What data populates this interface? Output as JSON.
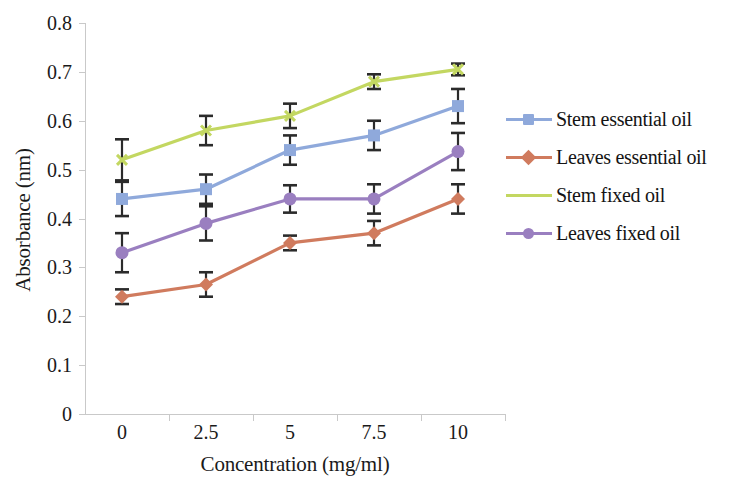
{
  "chart_data": {
    "type": "line",
    "title": "",
    "xlabel": "Concentration (mg/ml)",
    "ylabel": "Absorbance (nm)",
    "categories": [
      "0",
      "2.5",
      "5",
      "7.5",
      "10"
    ],
    "x": [
      0,
      2.5,
      5,
      7.5,
      10
    ],
    "ylim": [
      0,
      0.8
    ],
    "yticks": [
      "0",
      "0.1",
      "0.2",
      "0.3",
      "0.4",
      "0.5",
      "0.6",
      "0.7",
      "0.8"
    ],
    "ytick_values": [
      0,
      0.1,
      0.2,
      0.3,
      0.4,
      0.5,
      0.6,
      0.7,
      0.8
    ],
    "grid": false,
    "legend_position": "right",
    "errorbars": true,
    "series": [
      {
        "name": "Stem essential oil",
        "color": "#8FA9DB",
        "marker": "square",
        "values": [
          0.44,
          0.46,
          0.54,
          0.57,
          0.63
        ],
        "errors": [
          0.035,
          0.03,
          0.03,
          0.03,
          0.035
        ]
      },
      {
        "name": "Leaves essential oil",
        "color": "#D07B5E",
        "marker": "diamond",
        "values": [
          0.24,
          0.265,
          0.35,
          0.37,
          0.44
        ],
        "errors": [
          0.015,
          0.025,
          0.015,
          0.025,
          0.03
        ]
      },
      {
        "name": "Stem fixed oil",
        "color": "#C3D761",
        "marker": "none",
        "values": [
          0.52,
          0.58,
          0.61,
          0.68,
          0.705
        ],
        "errors": [
          0.042,
          0.03,
          0.025,
          0.015,
          0.012
        ]
      },
      {
        "name": "Leaves fixed oil",
        "color": "#9A7FC0",
        "marker": "circle",
        "values": [
          0.33,
          0.39,
          0.44,
          0.44,
          0.537
        ],
        "errors": [
          0.04,
          0.035,
          0.028,
          0.03,
          0.038
        ]
      }
    ]
  },
  "axes": {
    "y_title": "Absorbance (nm)",
    "x_title": "Concentration (mg/ml)"
  },
  "legend": {
    "items": [
      {
        "label": "Stem essential oil"
      },
      {
        "label": "Leaves essential oil"
      },
      {
        "label": "Stem fixed oil"
      },
      {
        "label": "Leaves fixed oil"
      }
    ]
  },
  "colors": {
    "series_1": "#8FA9DB",
    "series_2": "#D07B5E",
    "series_3": "#C3D761",
    "series_4": "#9A7FC0",
    "axis": "#c9c9c9",
    "text": "#1a1a1a",
    "errorbar": "#2b2b2b",
    "background": "#ffffff"
  }
}
